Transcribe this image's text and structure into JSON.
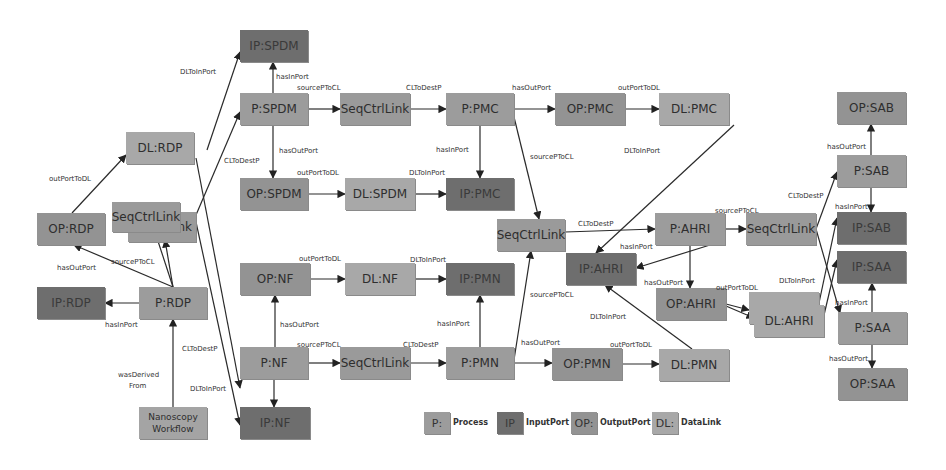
{
  "diagram": {
    "nodes": [
      {
        "id": "IP_SPDM",
        "label": "IP:SPDM",
        "type": "IP",
        "x": 240,
        "y": 30,
        "w": 68,
        "h": 32
      },
      {
        "id": "P_SPDM",
        "label": "P:SPDM",
        "type": "P",
        "x": 240,
        "y": 93,
        "w": 68,
        "h": 32
      },
      {
        "id": "OP_SPDM",
        "label": "OP:SPDM",
        "type": "OP",
        "x": 240,
        "y": 178,
        "w": 68,
        "h": 32
      },
      {
        "id": "DL_RDP",
        "label": "DL:RDP",
        "type": "DL",
        "x": 126,
        "y": 132,
        "w": 68,
        "h": 32
      },
      {
        "id": "OP_RDP",
        "label": "OP:RDP",
        "type": "OP",
        "x": 37,
        "y": 213,
        "w": 68,
        "h": 32
      },
      {
        "id": "SCL_RDP_back",
        "label": "nk",
        "type": "SCL",
        "x": 128,
        "y": 212,
        "w": 68,
        "h": 30
      },
      {
        "id": "SCL_RDP",
        "label": "SeqCtrlLink",
        "type": "SCL",
        "x": 112,
        "y": 202,
        "w": 68,
        "h": 30
      },
      {
        "id": "IP_RDP",
        "label": "IP:RDP",
        "type": "IP",
        "x": 37,
        "y": 287,
        "w": 68,
        "h": 32
      },
      {
        "id": "P_RDP",
        "label": "P:RDP",
        "type": "P",
        "x": 139,
        "y": 287,
        "w": 68,
        "h": 32
      },
      {
        "id": "WF",
        "label": "Nanoscopy Workflow",
        "type": "WF",
        "x": 139,
        "y": 407,
        "w": 68,
        "h": 32
      },
      {
        "id": "SCL_SPDM",
        "label": "SeqCtrlLink",
        "type": "SCL",
        "x": 340,
        "y": 93,
        "w": 70,
        "h": 32
      },
      {
        "id": "P_PMC",
        "label": "P:PMC",
        "type": "P",
        "x": 446,
        "y": 93,
        "w": 68,
        "h": 32
      },
      {
        "id": "OP_PMC",
        "label": "OP:PMC",
        "type": "OP",
        "x": 555,
        "y": 93,
        "w": 70,
        "h": 32
      },
      {
        "id": "DL_PMC",
        "label": "DL:PMC",
        "type": "DL",
        "x": 659,
        "y": 93,
        "w": 70,
        "h": 32
      },
      {
        "id": "DL_SPDM",
        "label": "DL:SPDM",
        "type": "DL",
        "x": 345,
        "y": 178,
        "w": 70,
        "h": 32
      },
      {
        "id": "IP_PMC",
        "label": "IP:PMC",
        "type": "IP",
        "x": 446,
        "y": 178,
        "w": 68,
        "h": 32
      },
      {
        "id": "SCL_MID",
        "label": "SeqCtrlLink",
        "type": "SCL",
        "x": 497,
        "y": 219,
        "w": 68,
        "h": 32
      },
      {
        "id": "P_AHRI",
        "label": "P:AHRI",
        "type": "P",
        "x": 655,
        "y": 213,
        "w": 70,
        "h": 32
      },
      {
        "id": "SCL_AHRI",
        "label": "SeqCtrlLink",
        "type": "SCL",
        "x": 746,
        "y": 213,
        "w": 70,
        "h": 32
      },
      {
        "id": "IP_AHRI",
        "label": "IP:AHRI",
        "type": "IP",
        "x": 566,
        "y": 253,
        "w": 70,
        "h": 32
      },
      {
        "id": "OP_AHRI",
        "label": "OP:AHRI",
        "type": "OP",
        "x": 656,
        "y": 288,
        "w": 70,
        "h": 32
      },
      {
        "id": "DL_AHRI_back",
        "label": "",
        "type": "DL",
        "x": 749,
        "y": 292,
        "w": 70,
        "h": 32
      },
      {
        "id": "DL_AHRI",
        "label": "DL:AHRI",
        "type": "DL",
        "x": 754,
        "y": 305,
        "w": 70,
        "h": 32
      },
      {
        "id": "OP_NF",
        "label": "OP:NF",
        "type": "OP",
        "x": 240,
        "y": 263,
        "w": 70,
        "h": 32
      },
      {
        "id": "DL_NF",
        "label": "DL:NF",
        "type": "DL",
        "x": 345,
        "y": 263,
        "w": 70,
        "h": 32
      },
      {
        "id": "IP_PMN",
        "label": "IP:PMN",
        "type": "IP",
        "x": 446,
        "y": 263,
        "w": 68,
        "h": 32
      },
      {
        "id": "P_NF",
        "label": "P:NF",
        "type": "P",
        "x": 240,
        "y": 347,
        "w": 68,
        "h": 32
      },
      {
        "id": "SCL_NF",
        "label": "SeqCtrlLink",
        "type": "SCL",
        "x": 340,
        "y": 347,
        "w": 70,
        "h": 32
      },
      {
        "id": "P_PMN",
        "label": "P:PMN",
        "type": "P",
        "x": 446,
        "y": 347,
        "w": 68,
        "h": 32
      },
      {
        "id": "OP_PMN",
        "label": "OP:PMN",
        "type": "OP",
        "x": 552,
        "y": 348,
        "w": 70,
        "h": 32
      },
      {
        "id": "DL_PMN",
        "label": "DL:PMN",
        "type": "DL",
        "x": 659,
        "y": 349,
        "w": 70,
        "h": 32
      },
      {
        "id": "IP_NF",
        "label": "IP:NF",
        "type": "IP",
        "x": 240,
        "y": 407,
        "w": 70,
        "h": 32
      },
      {
        "id": "OP_SAB",
        "label": "OP:SAB",
        "type": "OP",
        "x": 837,
        "y": 92,
        "w": 69,
        "h": 32
      },
      {
        "id": "P_SAB",
        "label": "P:SAB",
        "type": "P",
        "x": 837,
        "y": 155,
        "w": 69,
        "h": 32
      },
      {
        "id": "IP_SAB",
        "label": "IP:SAB",
        "type": "IP",
        "x": 837,
        "y": 212,
        "w": 69,
        "h": 32
      },
      {
        "id": "IP_SAA",
        "label": "IP:SAA",
        "type": "IP",
        "x": 837,
        "y": 251,
        "w": 69,
        "h": 32
      },
      {
        "id": "P_SAA",
        "label": "P:SAA",
        "type": "P",
        "x": 838,
        "y": 312,
        "w": 69,
        "h": 32
      },
      {
        "id": "OP_SAA",
        "label": "OP:SAA",
        "type": "OP",
        "x": 838,
        "y": 368,
        "w": 69,
        "h": 32
      }
    ],
    "edge_labels": [
      {
        "text": "DLToInPort",
        "x": 180,
        "y": 68
      },
      {
        "text": "hasInPort",
        "x": 276,
        "y": 73
      },
      {
        "text": "sourcePToCL",
        "x": 297,
        "y": 84
      },
      {
        "text": "CLToDestP",
        "x": 406,
        "y": 84
      },
      {
        "text": "hasOutPort",
        "x": 512,
        "y": 84
      },
      {
        "text": "outPortToDL",
        "x": 618,
        "y": 84
      },
      {
        "text": "CLToDestP",
        "x": 224,
        "y": 157
      },
      {
        "text": "hasOutPort",
        "x": 279,
        "y": 147
      },
      {
        "text": "outPortToDL",
        "x": 297,
        "y": 169
      },
      {
        "text": "DLToInPort",
        "x": 409,
        "y": 169
      },
      {
        "text": "hasInPort",
        "x": 436,
        "y": 146
      },
      {
        "text": "sourcePToCL",
        "x": 530,
        "y": 153
      },
      {
        "text": "DLToInPort",
        "x": 624,
        "y": 147
      },
      {
        "text": "outPortToDL",
        "x": 49,
        "y": 175
      },
      {
        "text": "sourcePToCL",
        "x": 111,
        "y": 258
      },
      {
        "text": "hasOutPort",
        "x": 57,
        "y": 264
      },
      {
        "text": "hasInPort",
        "x": 105,
        "y": 321
      },
      {
        "text": "CLToDestP",
        "x": 182,
        "y": 345
      },
      {
        "text": "wasDerived",
        "x": 118,
        "y": 371
      },
      {
        "text": "From",
        "x": 129,
        "y": 382
      },
      {
        "text": "DLToInPort",
        "x": 190,
        "y": 385
      },
      {
        "text": "outPortToDL",
        "x": 299,
        "y": 255
      },
      {
        "text": "DLToInPort",
        "x": 410,
        "y": 256
      },
      {
        "text": "hasOutPort",
        "x": 280,
        "y": 321
      },
      {
        "text": "sourcePToCL",
        "x": 297,
        "y": 341
      },
      {
        "text": "CLToDestP",
        "x": 403,
        "y": 341
      },
      {
        "text": "hasInPort",
        "x": 437,
        "y": 320
      },
      {
        "text": "sourcePToCL",
        "x": 530,
        "y": 291
      },
      {
        "text": "hasOutPort",
        "x": 521,
        "y": 339
      },
      {
        "text": "outPortToDL",
        "x": 610,
        "y": 341
      },
      {
        "text": "DLToInPort",
        "x": 590,
        "y": 313
      },
      {
        "text": "hasInPort",
        "x": 620,
        "y": 243
      },
      {
        "text": "hasOutPort",
        "x": 644,
        "y": 279
      },
      {
        "text": "CLToDestP",
        "x": 578,
        "y": 220
      },
      {
        "text": "sourcePToCL",
        "x": 715,
        "y": 207
      },
      {
        "text": "outPortToDL",
        "x": 716,
        "y": 284
      },
      {
        "text": "CLToDestP",
        "x": 788,
        "y": 192
      },
      {
        "text": "hasInPort",
        "x": 835,
        "y": 203
      },
      {
        "text": "hasOutPort",
        "x": 827,
        "y": 143
      },
      {
        "text": "DLToInPort",
        "x": 779,
        "y": 277
      },
      {
        "text": "hasInPort",
        "x": 835,
        "y": 299
      },
      {
        "text": "hasOutPort",
        "x": 829,
        "y": 355
      }
    ],
    "edges": [
      [
        207,
        150,
        240,
        52
      ],
      [
        273,
        93,
        273,
        62
      ],
      [
        196,
        215,
        240,
        112
      ],
      [
        273,
        125,
        273,
        178
      ],
      [
        308,
        109,
        340,
        109
      ],
      [
        410,
        109,
        446,
        109
      ],
      [
        514,
        109,
        555,
        109
      ],
      [
        625,
        109,
        659,
        109
      ],
      [
        308,
        194,
        345,
        194
      ],
      [
        415,
        194,
        446,
        194
      ],
      [
        480,
        125,
        480,
        178
      ],
      [
        514,
        117,
        539,
        219
      ],
      [
        734,
        125,
        596,
        253
      ],
      [
        72,
        213,
        126,
        155
      ],
      [
        173,
        287,
        155,
        232
      ],
      [
        173,
        287,
        165,
        240
      ],
      [
        173,
        287,
        74,
        245
      ],
      [
        139,
        303,
        105,
        303
      ],
      [
        173,
        407,
        173,
        319
      ],
      [
        196,
        158,
        240,
        388
      ],
      [
        196,
        222,
        240,
        425
      ],
      [
        275,
        347,
        275,
        295
      ],
      [
        310,
        279,
        345,
        279
      ],
      [
        415,
        279,
        446,
        279
      ],
      [
        274,
        379,
        274,
        407
      ],
      [
        308,
        363,
        340,
        363
      ],
      [
        410,
        363,
        446,
        363
      ],
      [
        480,
        347,
        480,
        295
      ],
      [
        514,
        360,
        531,
        251
      ],
      [
        514,
        363,
        552,
        363
      ],
      [
        622,
        364,
        659,
        364
      ],
      [
        692,
        349,
        605,
        285
      ],
      [
        565,
        232,
        655,
        229
      ],
      [
        725,
        229,
        746,
        229
      ],
      [
        710,
        245,
        636,
        268
      ],
      [
        690,
        245,
        690,
        288
      ],
      [
        726,
        304,
        749,
        310
      ],
      [
        726,
        306,
        754,
        318
      ],
      [
        816,
        229,
        837,
        172
      ],
      [
        871,
        155,
        871,
        124
      ],
      [
        871,
        187,
        871,
        212
      ],
      [
        816,
        229,
        840,
        313
      ],
      [
        819,
        303,
        837,
        218
      ],
      [
        824,
        315,
        837,
        260
      ],
      [
        872,
        312,
        872,
        283
      ],
      [
        872,
        344,
        872,
        368
      ]
    ],
    "legend": [
      {
        "box": "P:",
        "text": "Process",
        "type": "P",
        "x": 424,
        "y": 412,
        "tx": 453
      },
      {
        "box": "IP",
        "text": "InputPort",
        "type": "IP",
        "x": 497,
        "y": 412,
        "tx": 526
      },
      {
        "box": "OP:",
        "text": "OutputPort",
        "type": "OP",
        "x": 571,
        "y": 412,
        "tx": 600
      },
      {
        "box": "DL:",
        "text": "DataLink",
        "type": "DL",
        "x": 652,
        "y": 412,
        "tx": 681
      }
    ]
  }
}
